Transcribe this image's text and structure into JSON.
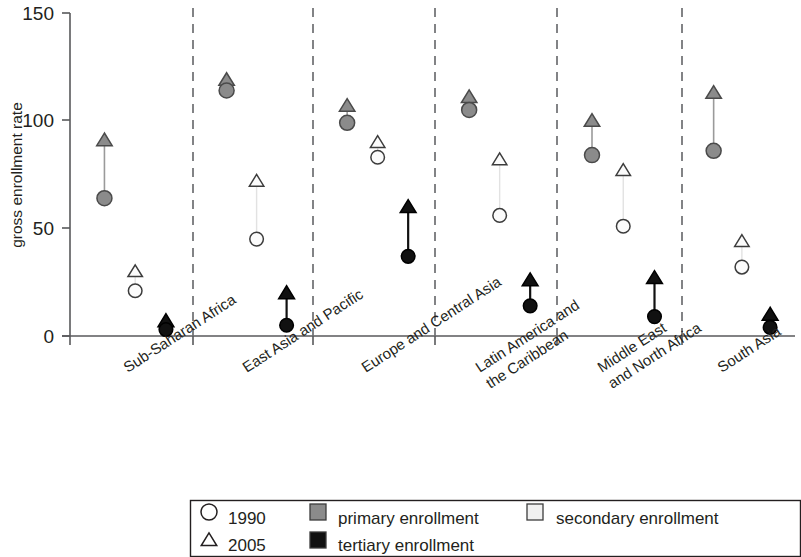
{
  "chart_data": {
    "type": "scatter",
    "title": "",
    "xlabel": "",
    "ylabel": "gross enrollment rate",
    "ylim": [
      0,
      150
    ],
    "yticks": [
      0,
      50,
      100,
      150
    ],
    "ytick_labels": [
      "0",
      "50",
      "100",
      "150"
    ],
    "grid": false,
    "legend_position": "bottom",
    "categories": [
      "Sub-Saharan Africa",
      "East Asia and Pacific",
      "Europe and Central Asia",
      "Latin America and\nthe Caribbean",
      "Middle East\nand North Africa",
      "South Asia"
    ],
    "category_labels": [
      [
        "Sub-Saharan Africa"
      ],
      [
        "East Asia and Pacific"
      ],
      [
        "Europe and Central Asia"
      ],
      [
        "Latin America and",
        "the Caribbean"
      ],
      [
        "Middle East",
        "and North Africa"
      ],
      [
        "South Asia"
      ]
    ],
    "series_markers": {
      "1990": "circle",
      "2005": "triangle"
    },
    "level_colors": {
      "primary enrollment": "#8b8b8b",
      "secondary enrollment": "#f0f0f0",
      "tertiary enrollment": "#111111"
    },
    "series": [
      {
        "name": "primary enrollment",
        "level": "primary",
        "values_1990": [
          64,
          114,
          99,
          105,
          84,
          86
        ],
        "values_2005": [
          91,
          119,
          107,
          111,
          100,
          113
        ]
      },
      {
        "name": "secondary enrollment",
        "level": "secondary",
        "values_1990": [
          21,
          45,
          83,
          56,
          51,
          32
        ],
        "values_2005": [
          30,
          72,
          90,
          82,
          77,
          44
        ]
      },
      {
        "name": "tertiary enrollment",
        "level": "tertiary",
        "values_1990": [
          3,
          5,
          37,
          14,
          9,
          4
        ],
        "values_2005": [
          7,
          20,
          60,
          26,
          27,
          10
        ]
      }
    ]
  },
  "legend": {
    "entries": [
      {
        "id": "legend-1990",
        "marker": "circle-open",
        "label": "1990"
      },
      {
        "id": "legend-2005",
        "marker": "triangle-open",
        "label": "2005"
      },
      {
        "id": "legend-primary",
        "marker": "square-gray",
        "label": "primary enrollment"
      },
      {
        "id": "legend-tertiary",
        "marker": "square-black",
        "label": "tertiary enrollment"
      },
      {
        "id": "legend-secondary",
        "marker": "square-light",
        "label": "secondary enrollment"
      }
    ]
  },
  "axis": {
    "y_title": "gross enrollment rate",
    "y_tick_0": "0",
    "y_tick_50": "50",
    "y_tick_100": "100",
    "y_tick_150": "150"
  }
}
